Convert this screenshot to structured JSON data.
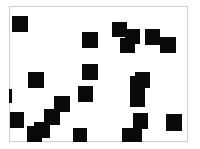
{
  "canvas": {
    "width": 200,
    "height": 149,
    "background": "#ffffff",
    "frame": {
      "x": 9,
      "y": 6,
      "w": 179,
      "h": 136,
      "border_color": "#cfcfcf"
    },
    "square_color": "#0a0a0a"
  },
  "squares": [
    {
      "x": 12,
      "y": 16,
      "w": 16,
      "h": 16
    },
    {
      "x": 82,
      "y": 32,
      "w": 16,
      "h": 16
    },
    {
      "x": 112,
      "y": 22,
      "w": 15,
      "h": 15
    },
    {
      "x": 125,
      "y": 29,
      "w": 15,
      "h": 15
    },
    {
      "x": 120,
      "y": 38,
      "w": 15,
      "h": 15
    },
    {
      "x": 145,
      "y": 29,
      "w": 15,
      "h": 16
    },
    {
      "x": 160,
      "y": 37,
      "w": 16,
      "h": 16
    },
    {
      "x": 82,
      "y": 64,
      "w": 16,
      "h": 16
    },
    {
      "x": 28,
      "y": 72,
      "w": 16,
      "h": 16
    },
    {
      "x": 78,
      "y": 86,
      "w": 15,
      "h": 16
    },
    {
      "x": 9,
      "y": 89,
      "w": 3,
      "h": 14
    },
    {
      "x": 135,
      "y": 72,
      "w": 15,
      "h": 16
    },
    {
      "x": 130,
      "y": 76,
      "w": 15,
      "h": 31
    },
    {
      "x": 54,
      "y": 96,
      "w": 16,
      "h": 16
    },
    {
      "x": 44,
      "y": 109,
      "w": 16,
      "h": 16
    },
    {
      "x": 10,
      "y": 112,
      "w": 14,
      "h": 16
    },
    {
      "x": 34,
      "y": 122,
      "w": 16,
      "h": 16
    },
    {
      "x": 27,
      "y": 126,
      "w": 15,
      "h": 16
    },
    {
      "x": 73,
      "y": 128,
      "w": 14,
      "h": 14
    },
    {
      "x": 133,
      "y": 113,
      "w": 15,
      "h": 16
    },
    {
      "x": 122,
      "y": 128,
      "w": 20,
      "h": 14
    },
    {
      "x": 166,
      "y": 114,
      "w": 16,
      "h": 17
    }
  ]
}
